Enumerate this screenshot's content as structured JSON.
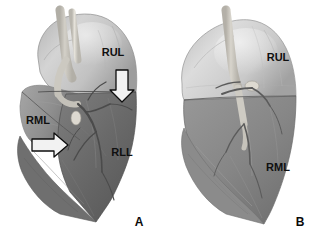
{
  "figure": {
    "background_color": "#ffffff",
    "panel_count": 2
  },
  "palette": {
    "background": "#ffffff",
    "upper_lobe_light": "#c8c8c8",
    "upper_lobe_highlight": "#e2e2e2",
    "lower_lobe_dark": "#6e6e6e",
    "mid_lobe_gray": "#8a8a8a",
    "airway_pale": "#d9d6cf",
    "vessel_gray": "#5a5a5a",
    "label_text": "#101010",
    "arrow_fill": "#f2f2f2",
    "arrow_stroke": "#0d0d0d"
  },
  "panels": [
    {
      "id": "A",
      "letter": "A",
      "letter_pos": {
        "x": 139,
        "y": 226
      },
      "description": "Right lung, lateral view with two annotation arrows",
      "labels": [
        {
          "name": "rul",
          "text": "RUL",
          "x": 113,
          "y": 56,
          "anchor": "middle"
        },
        {
          "name": "rml",
          "text": "RML",
          "x": 38,
          "y": 124,
          "anchor": "middle"
        },
        {
          "name": "rll",
          "text": "RLL",
          "x": 122,
          "y": 156,
          "anchor": "middle"
        }
      ],
      "arrows": [
        {
          "name": "down-arrow",
          "direction": "down",
          "x": 122,
          "y": 70,
          "length": 30,
          "width": 15
        },
        {
          "name": "right-arrow",
          "direction": "right",
          "x": 32,
          "y": 145,
          "length": 34,
          "width": 15
        }
      ]
    },
    {
      "id": "B",
      "letter": "B",
      "letter_pos": {
        "x": 300,
        "y": 226
      },
      "description": "Right lung, lateral view without arrows",
      "labels": [
        {
          "name": "rul",
          "text": "RUL",
          "x": 118,
          "y": 61,
          "anchor": "middle"
        },
        {
          "name": "rml",
          "text": "RML",
          "x": 118,
          "y": 171,
          "anchor": "middle"
        }
      ],
      "arrows": []
    }
  ]
}
